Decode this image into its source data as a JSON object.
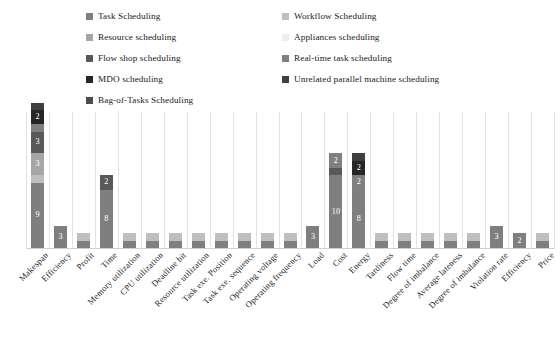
{
  "chart_data": {
    "type": "bar",
    "subtype": "stacked-bar",
    "title": "",
    "xlabel": "",
    "ylabel": "",
    "grid": "vertical-only",
    "legend_position": "top",
    "ylim": [
      0,
      18
    ],
    "categories": [
      "Makespan",
      "Efficiency",
      "Profit",
      "Time",
      "Memory utilization",
      "CPU utilization",
      "Deadline hit",
      "Resource utilization",
      "Task exe. Position",
      "Task exe. sequence",
      "Operating voltage",
      "Operating frequency",
      "Load",
      "Cost",
      "Energy",
      "Tardiness",
      "Flow time",
      "Degree of imbalance",
      "Average lateness",
      "Degree of imbalance",
      "Violation rate",
      "Efficiency",
      "Price"
    ],
    "series": [
      {
        "name": "Task Scheduling",
        "color": "#7f7f7f",
        "values": [
          9,
          3,
          1,
          8,
          1,
          1,
          1,
          1,
          1,
          1,
          1,
          1,
          3,
          10,
          8,
          1,
          1,
          1,
          1,
          1,
          3,
          2,
          1
        ]
      },
      {
        "name": "Workflow Scheduling",
        "color": "#bfbfbf",
        "values": [
          1,
          0,
          1,
          0,
          1,
          1,
          1,
          1,
          1,
          1,
          1,
          1,
          0,
          0,
          0,
          1,
          1,
          1,
          1,
          1,
          0,
          0,
          1
        ]
      },
      {
        "name": "Resource scheduling",
        "color": "#a6a6a6",
        "values": [
          3,
          0,
          0,
          0,
          0,
          0,
          0,
          0,
          0,
          0,
          0,
          0,
          0,
          0,
          0,
          0,
          0,
          0,
          0,
          0,
          0,
          0,
          0
        ]
      },
      {
        "name": "Appliances scheduling",
        "color": "#ededed",
        "values": [
          0,
          0,
          0,
          0,
          0,
          0,
          0,
          0,
          0,
          0,
          0,
          0,
          0,
          0,
          0,
          0,
          0,
          0,
          0,
          0,
          0,
          0,
          0
        ]
      },
      {
        "name": "Flow shop scheduling",
        "color": "#595959",
        "values": [
          3,
          0,
          0,
          2,
          0,
          0,
          0,
          0,
          0,
          0,
          0,
          0,
          0,
          1,
          0,
          0,
          0,
          0,
          0,
          0,
          0,
          0,
          0
        ]
      },
      {
        "name": "Real-time task scheduling",
        "color": "#808080",
        "values": [
          1,
          0,
          0,
          0,
          0,
          0,
          0,
          0,
          0,
          0,
          0,
          0,
          0,
          2,
          2,
          0,
          0,
          0,
          0,
          0,
          0,
          0,
          0
        ]
      },
      {
        "name": "MDO scheduling",
        "color": "#262626",
        "values": [
          2,
          0,
          0,
          0,
          0,
          0,
          0,
          0,
          0,
          0,
          0,
          0,
          0,
          0,
          2,
          0,
          0,
          0,
          0,
          0,
          0,
          0,
          0
        ]
      },
      {
        "name": "Unrelated parallel machine scheduling",
        "color": "#3f3f3f",
        "values": [
          1,
          0,
          0,
          0,
          0,
          0,
          0,
          0,
          0,
          0,
          0,
          0,
          0,
          0,
          1,
          0,
          0,
          0,
          0,
          0,
          0,
          0,
          0
        ]
      },
      {
        "name": "Bag-of-Tasks Scheduling",
        "color": "#4d4d4d",
        "values": [
          0,
          0,
          0,
          0,
          0,
          0,
          0,
          0,
          0,
          0,
          0,
          0,
          0,
          0,
          0,
          0,
          0,
          0,
          0,
          0,
          0,
          0,
          0
        ]
      }
    ],
    "bar_value_labels": {
      "Makespan": [
        "9",
        "1",
        "3",
        "3",
        "1",
        "2"
      ],
      "Efficiency": [
        "3"
      ],
      "Time": [
        "8",
        "2"
      ],
      "Cost": [
        "10",
        "1",
        "2"
      ],
      "Energy": [
        "8",
        "2"
      ],
      "Violation rate": [
        "3"
      ],
      "Efficiency_2": [
        "2"
      ]
    }
  },
  "legend": {
    "items": [
      {
        "label": "Task Scheduling",
        "color": "#7f7f7f"
      },
      {
        "label": "Workflow Scheduling",
        "color": "#bfbfbf"
      },
      {
        "label": "Resource scheduling",
        "color": "#a6a6a6"
      },
      {
        "label": "Appliances scheduling",
        "color": "#ededed"
      },
      {
        "label": "Flow shop scheduling",
        "color": "#595959"
      },
      {
        "label": "Real-time task scheduling",
        "color": "#808080"
      },
      {
        "label": "MDO scheduling",
        "color": "#262626"
      },
      {
        "label": "Unrelated parallel machine scheduling",
        "color": "#3f3f3f"
      },
      {
        "label": "Bag-of-Tasks Scheduling",
        "color": "#4d4d4d"
      }
    ]
  },
  "colors": {
    "background": "#ffffff",
    "gridline": "#e2e2e2",
    "axis": "#d0d0d0",
    "text": "#1c1c1c",
    "label_text": "#ffffff"
  }
}
